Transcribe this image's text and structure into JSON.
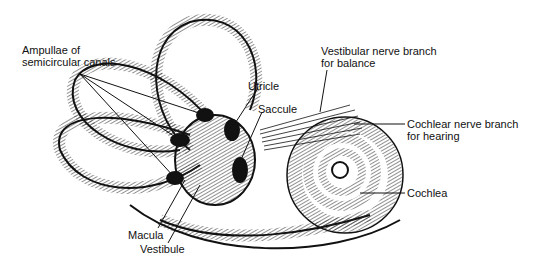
{
  "diagram": {
    "labels": {
      "ampullae_line1": "Ampullae of",
      "ampullae_line2": "semicircular canals",
      "utricle": "Utricle",
      "saccule": "Saccule",
      "vestibular_line1": "Vestibular nerve branch",
      "vestibular_line2": "for balance",
      "cochlear_line1": "Cochlear nerve branch",
      "cochlear_line2": "for hearing",
      "cochlea": "Cochlea",
      "macula": "Macula",
      "vestibule": "Vestibule"
    },
    "colors": {
      "ink": "#111111",
      "background": "#ffffff"
    }
  }
}
